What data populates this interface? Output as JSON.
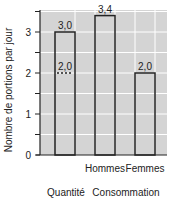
{
  "chart_data": {
    "type": "bar",
    "title": "",
    "xlabel": "",
    "ylabel": "Nombre de portions par jour",
    "ylim": [
      0,
      3.5
    ],
    "yticks": [
      0,
      1,
      2,
      3
    ],
    "grid": true,
    "categories": [
      "Quantité",
      "Hommes",
      "Femmes"
    ],
    "values": [
      3.0,
      3.4,
      2.0
    ],
    "value_labels": [
      "3,0",
      "3,4",
      "2,0"
    ],
    "annotations": [
      {
        "category": "Quantité",
        "value": 2.0,
        "label": "2,0",
        "style": "dotted"
      }
    ],
    "group_labels": [
      "Quantité",
      "Consommation"
    ],
    "tick_labels": [
      "Hommes",
      "Femmes"
    ],
    "colors": {
      "background": "#d4d4d4",
      "grid": "#ffffff",
      "bar_edge": "#222222"
    }
  }
}
